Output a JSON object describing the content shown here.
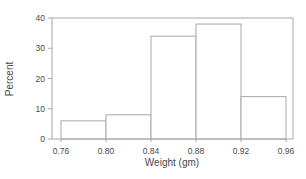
{
  "chart_data": {
    "type": "bar",
    "subtype": "histogram",
    "xlabel": "Weight (gm)",
    "ylabel": "Percent",
    "bin_edges": [
      0.76,
      0.8,
      0.84,
      0.88,
      0.92,
      0.96
    ],
    "values": [
      6,
      8,
      34,
      38,
      14
    ],
    "xtick_labels": [
      "0.76",
      "0.80",
      "0.84",
      "0.88",
      "0.92",
      "0.96"
    ],
    "yticks": [
      0,
      10,
      20,
      30,
      40
    ],
    "ylim": [
      0,
      40
    ],
    "grid": false,
    "legend": null,
    "bar_fill": "#ffffff",
    "line_color": "#a8a8a8",
    "text_color": "#4a4a4a",
    "background": "#ffffff"
  }
}
